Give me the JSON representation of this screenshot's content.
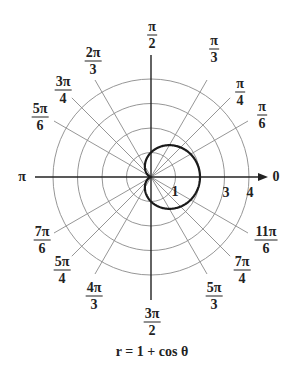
{
  "chart_data": {
    "type": "line",
    "subtype": "polar",
    "title": "",
    "caption": "r = 1 + cos θ",
    "equation": {
      "r": "1 + cos(theta)"
    },
    "center_px": [
      151,
      177
    ],
    "unit_px": 24.5,
    "rings": [
      1,
      2,
      3,
      4
    ],
    "ring_labels": [
      {
        "value": "1",
        "x": 175,
        "y": 192
      },
      {
        "value": "3",
        "x": 226,
        "y": 193
      },
      {
        "value": "4",
        "x": 250,
        "y": 193
      }
    ],
    "axis_labels": [
      {
        "id": "angle-0",
        "num": "0",
        "den": "",
        "x": 276,
        "y": 177,
        "single": true
      },
      {
        "id": "angle-pi",
        "num": "π",
        "den": "",
        "x": 22,
        "y": 177,
        "single": true
      }
    ],
    "angle_labels": [
      {
        "id": "angle-pi-6",
        "num": "π",
        "den": "6",
        "x": 262,
        "y": 115
      },
      {
        "id": "angle-pi-4",
        "num": "π",
        "den": "4",
        "x": 240,
        "y": 92
      },
      {
        "id": "angle-pi-3",
        "num": "π",
        "den": "3",
        "x": 214,
        "y": 49
      },
      {
        "id": "angle-pi-2",
        "num": "π",
        "den": "2",
        "x": 152,
        "y": 35
      },
      {
        "id": "angle-2pi-3",
        "num": "2π",
        "den": "3",
        "x": 93,
        "y": 61
      },
      {
        "id": "angle-3pi-4",
        "num": "3π",
        "den": "4",
        "x": 63,
        "y": 90
      },
      {
        "id": "angle-5pi-6",
        "num": "5π",
        "den": "6",
        "x": 40,
        "y": 117
      },
      {
        "id": "angle-7pi-6",
        "num": "7π",
        "den": "6",
        "x": 42,
        "y": 240
      },
      {
        "id": "angle-5pi-4",
        "num": "5π",
        "den": "4",
        "x": 62,
        "y": 270
      },
      {
        "id": "angle-4pi-3",
        "num": "4π",
        "den": "3",
        "x": 94,
        "y": 296
      },
      {
        "id": "angle-3pi-2",
        "num": "3π",
        "den": "2",
        "x": 152,
        "y": 322
      },
      {
        "id": "angle-5pi-3",
        "num": "5π",
        "den": "3",
        "x": 214,
        "y": 296
      },
      {
        "id": "angle-7pi-4",
        "num": "7π",
        "den": "4",
        "x": 242,
        "y": 270
      },
      {
        "id": "angle-11pi-6",
        "num": "11π",
        "den": "6",
        "x": 266,
        "y": 240
      }
    ],
    "radial_angles_deg": [
      30,
      45,
      60,
      120,
      135,
      150,
      210,
      225,
      240,
      300,
      315,
      330
    ],
    "radial_length_px": 112,
    "axes": {
      "horizontal": {
        "x1": 35,
        "x2": 268,
        "arrow": true
      },
      "vertical": {
        "y1": 55,
        "y2": 300
      }
    },
    "series": [
      {
        "name": "r = 1 + cos θ",
        "theta_deg": [
          0,
          30,
          60,
          90,
          120,
          150,
          180,
          210,
          240,
          270,
          300,
          330,
          360
        ],
        "r": [
          2,
          1.866,
          1.5,
          1,
          0.5,
          0.134,
          0,
          0.134,
          0.5,
          1,
          1.5,
          1.866,
          2
        ]
      }
    ],
    "grid": true,
    "colors": {
      "curve": "#1a1a1a",
      "grid": "#8a8a8a",
      "axis": "#222222"
    }
  }
}
